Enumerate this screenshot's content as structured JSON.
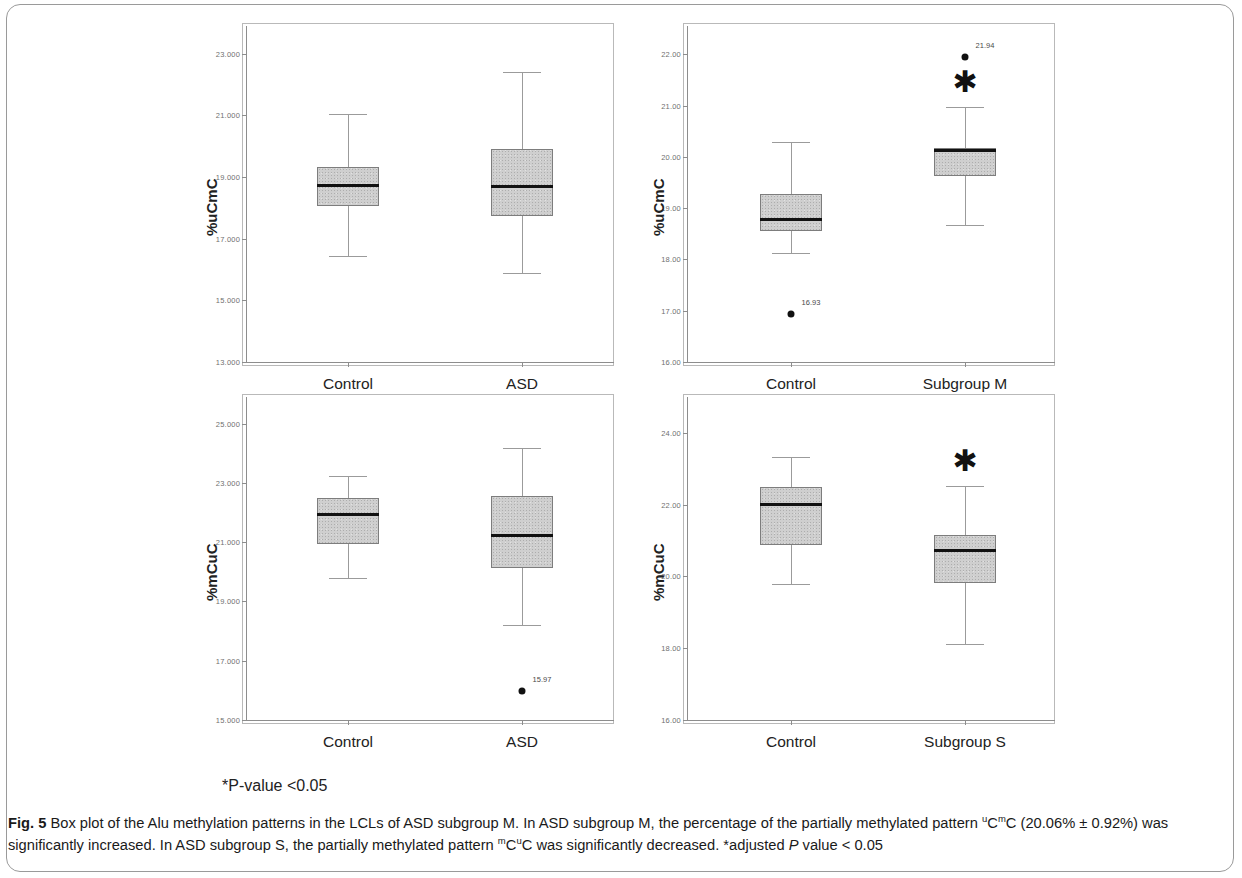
{
  "figure": {
    "pvalue_note": "*P-value <0.05",
    "caption_label": "Fig. 5",
    "caption_part1": " Box plot of the Alu methylation patterns in the LCLs of ASD subgroup M. In ASD subgroup M, the percentage of the partially methylated pattern ",
    "caption_sup1_a": "u",
    "caption_mid1": "C",
    "caption_sup1_b": "m",
    "caption_mid2": "C",
    "caption_part2": " (20.06% ± 0.92%) was significantly increased. In ASD subgroup S, the partially methylated pattern ",
    "caption_sup2_a": "m",
    "caption_mid3": "C",
    "caption_sup2_b": "u",
    "caption_mid4": "C",
    "caption_part3": " was significantly decreased. *adjusted ",
    "caption_italic": "P",
    "caption_part4": " value < 0.05"
  },
  "chart_data": [
    {
      "id": "panel-top-left",
      "type": "box",
      "title": "",
      "ylabel": "%uCmC",
      "xlabel": "",
      "ylim": [
        13.0,
        23.9
      ],
      "yticks": [
        13.0,
        15.0,
        17.0,
        19.0,
        21.0,
        23.0
      ],
      "ytick_labels": [
        "13.000",
        "15.000",
        "17.000",
        "19.000",
        "21.000",
        "23.000"
      ],
      "grid": false,
      "categories": [
        "Control",
        "ASD"
      ],
      "boxes": [
        {
          "category": "Control",
          "whisker_low": 16.45,
          "q1": 18.05,
          "median": 18.72,
          "q3": 19.33,
          "whisker_high": 21.05,
          "outliers": [],
          "significant": false
        },
        {
          "category": "ASD",
          "whisker_low": 15.88,
          "q1": 17.75,
          "median": 18.68,
          "q3": 19.9,
          "whisker_high": 22.42,
          "outliers": [],
          "significant": false
        }
      ]
    },
    {
      "id": "panel-top-right",
      "type": "box",
      "title": "",
      "ylabel": "%uCmC",
      "xlabel": "",
      "ylim": [
        16.0,
        22.55
      ],
      "yticks": [
        16.0,
        17.0,
        18.0,
        19.0,
        20.0,
        21.0,
        22.0
      ],
      "ytick_labels": [
        "16.00",
        "17.00",
        "18.00",
        "19.00",
        "20.00",
        "21.00",
        "22.00"
      ],
      "grid": false,
      "categories": [
        "Control",
        "Subgroup M"
      ],
      "boxes": [
        {
          "category": "Control",
          "whisker_low": 18.12,
          "q1": 18.55,
          "median": 18.78,
          "q3": 19.28,
          "whisker_high": 20.28,
          "outliers": [
            {
              "value": 16.93,
              "label": "16.93"
            }
          ],
          "significant": false
        },
        {
          "category": "Subgroup M",
          "whisker_low": 18.67,
          "q1": 19.62,
          "median": 20.12,
          "q3": 20.17,
          "whisker_high": 20.97,
          "outliers": [
            {
              "value": 21.94,
              "label": "21.94"
            }
          ],
          "significant": true,
          "star": "✱"
        }
      ]
    },
    {
      "id": "panel-bottom-left",
      "type": "box",
      "title": "",
      "ylabel": "%mCuC",
      "xlabel": "",
      "ylim": [
        15.0,
        25.9
      ],
      "yticks": [
        15.0,
        17.0,
        19.0,
        21.0,
        23.0,
        25.0
      ],
      "ytick_labels": [
        "15.000",
        "17.000",
        "19.000",
        "21.000",
        "23.000",
        "25.000"
      ],
      "grid": false,
      "categories": [
        "Control",
        "ASD"
      ],
      "boxes": [
        {
          "category": "Control",
          "whisker_low": 19.8,
          "q1": 20.93,
          "median": 21.95,
          "q3": 22.5,
          "whisker_high": 23.22,
          "outliers": [],
          "significant": false
        },
        {
          "category": "ASD",
          "whisker_low": 18.2,
          "q1": 20.12,
          "median": 21.22,
          "q3": 22.57,
          "whisker_high": 24.18,
          "outliers": [
            {
              "value": 15.97,
              "label": "15.97"
            }
          ],
          "significant": false
        }
      ]
    },
    {
      "id": "panel-bottom-right",
      "type": "box",
      "title": "",
      "ylabel": "%mCuC",
      "xlabel": "",
      "ylim": [
        16.0,
        25.0
      ],
      "yticks": [
        16.0,
        18.0,
        20.0,
        22.0,
        24.0
      ],
      "ytick_labels": [
        "16.00",
        "18.00",
        "20.00",
        "22.00",
        "24.00"
      ],
      "grid": false,
      "categories": [
        "Control",
        "Subgroup S"
      ],
      "boxes": [
        {
          "category": "Control",
          "whisker_low": 19.78,
          "q1": 20.88,
          "median": 22.0,
          "q3": 22.5,
          "whisker_high": 23.32,
          "outliers": [],
          "significant": false
        },
        {
          "category": "Subgroup S",
          "whisker_low": 18.12,
          "q1": 19.82,
          "median": 20.72,
          "q3": 21.15,
          "whisker_high": 22.52,
          "outliers": [],
          "significant": true,
          "star": "✱"
        }
      ]
    }
  ]
}
